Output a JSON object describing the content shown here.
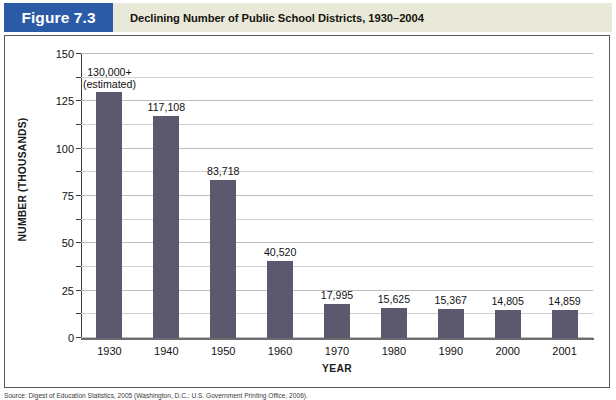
{
  "figure": {
    "badge_label": "Figure 7.3",
    "title": "Declining Number of Public School Districts, 1930–2004",
    "badge_color": "#2b5aa6",
    "header_background": "#e9e9d9",
    "source_note": "Source: Digest of Education Statistics, 2005 (Washington, D.C.: U.S. Government Printing Office, 2006)."
  },
  "chart_data": {
    "type": "bar",
    "title": "Declining Number of Public School Districts, 1930–2004",
    "xlabel": "YEAR",
    "ylabel": "NUMBER (THOUSANDS)",
    "ylim": [
      0,
      150
    ],
    "yticks": [
      0,
      25,
      50,
      75,
      100,
      125,
      150
    ],
    "ytick_labels": [
      "0",
      "25",
      "50",
      "75",
      "100",
      "125",
      "150"
    ],
    "minor_tick_interval": 12.5,
    "grid": true,
    "legend": "none",
    "bar_color": "#5c596e",
    "categories": [
      "1930",
      "1940",
      "1950",
      "1960",
      "1970",
      "1980",
      "1990",
      "2000",
      "2001"
    ],
    "values": [
      130.0,
      117.108,
      83.718,
      40.52,
      17.995,
      15.625,
      15.367,
      14.805,
      14.859
    ],
    "data_labels": [
      "130,000+\n(estimated)",
      "117,108",
      "83,718",
      "40,520",
      "17,995",
      "15,625",
      "15,367",
      "14,805",
      "14,859"
    ],
    "bars": [
      {
        "category": "1930",
        "value": 130.0,
        "label_line1": "130,000+",
        "label_line2": "(estimated)"
      },
      {
        "category": "1940",
        "value": 117.108,
        "label_line1": "117,108",
        "label_line2": ""
      },
      {
        "category": "1950",
        "value": 83.718,
        "label_line1": "83,718",
        "label_line2": ""
      },
      {
        "category": "1960",
        "value": 40.52,
        "label_line1": "40,520",
        "label_line2": ""
      },
      {
        "category": "1970",
        "value": 17.995,
        "label_line1": "17,995",
        "label_line2": ""
      },
      {
        "category": "1980",
        "value": 15.625,
        "label_line1": "15,625",
        "label_line2": ""
      },
      {
        "category": "1990",
        "value": 15.367,
        "label_line1": "15,367",
        "label_line2": ""
      },
      {
        "category": "2000",
        "value": 14.805,
        "label_line1": "14,805",
        "label_line2": ""
      },
      {
        "category": "2001",
        "value": 14.859,
        "label_line1": "14,859",
        "label_line2": ""
      }
    ]
  }
}
